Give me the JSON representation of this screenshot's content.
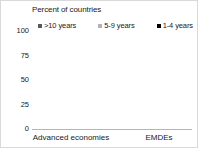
{
  "chart_data": {
    "type": "bar",
    "subtype": "stacked-vertical-100",
    "title": "Percent of countries",
    "xlabel": "",
    "ylabel": "",
    "ylim": [
      0,
      100
    ],
    "yticks": [
      100,
      75,
      50,
      25,
      0
    ],
    "ytick_labels": [
      "100",
      "75",
      "50",
      "25",
      "0"
    ],
    "grid": false,
    "legend_position": "top",
    "categories": [
      "Advanced economies",
      "EMDEs"
    ],
    "series": [
      {
        "name": ">10 years",
        "color": "#595959",
        "values": [
          15,
          27
        ]
      },
      {
        "name": "5-9 years",
        "color": "#b3b3b3",
        "values": [
          37,
          29
        ]
      },
      {
        "name": "1-4 years",
        "color": "#000000",
        "values": [
          48,
          44
        ]
      }
    ]
  },
  "colors": {
    "more_than_10_years": "#595959",
    "five_to_nine_years": "#b3b3b3",
    "one_to_four_years": "#000000",
    "axis": "#b5b5b5",
    "text": "#1a1a1a",
    "background": "#ffffff",
    "border": "#d9d9d9"
  }
}
